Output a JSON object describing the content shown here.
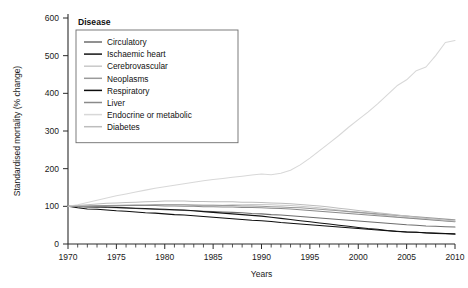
{
  "chart_data": {
    "type": "line",
    "title": "",
    "xlabel": "Years",
    "ylabel": "Standardised mortality (% change)",
    "xlim": [
      1970,
      2010
    ],
    "ylim": [
      0,
      600
    ],
    "xticks": [
      1970,
      1975,
      1980,
      1985,
      1990,
      1995,
      2000,
      2005,
      2010
    ],
    "yticks": [
      0,
      100,
      200,
      300,
      400,
      500,
      600
    ],
    "minor_x_tick_interval": 1,
    "grid": false,
    "legend_position": "top-left",
    "legend_title": "Disease",
    "x": [
      1970,
      1971,
      1972,
      1973,
      1974,
      1975,
      1976,
      1977,
      1978,
      1979,
      1980,
      1981,
      1982,
      1983,
      1984,
      1985,
      1986,
      1987,
      1988,
      1989,
      1990,
      1991,
      1992,
      1993,
      1994,
      1995,
      1996,
      1997,
      1998,
      1999,
      2000,
      2001,
      2002,
      2003,
      2004,
      2005,
      2006,
      2007,
      2008,
      2009,
      2010
    ],
    "series": [
      {
        "name": "Circulatory",
        "color": "#6d6d6d",
        "values": [
          100,
          99,
          98,
          99,
          97,
          96,
          95,
          94,
          93,
          92,
          91,
          90,
          89,
          88,
          87,
          86,
          85,
          84,
          83,
          81,
          80,
          78,
          77,
          75,
          73,
          71,
          69,
          67,
          65,
          63,
          61,
          59,
          57,
          55,
          53,
          51,
          50,
          48,
          47,
          46,
          45
        ]
      },
      {
        "name": "Ischaemic heart",
        "color": "#141414",
        "values": [
          100,
          100,
          99,
          98,
          98,
          97,
          96,
          95,
          94,
          93,
          92,
          91,
          90,
          88,
          86,
          84,
          82,
          80,
          78,
          76,
          74,
          71,
          68,
          65,
          62,
          59,
          56,
          53,
          50,
          47,
          44,
          41,
          39,
          36,
          34,
          32,
          31,
          29,
          28,
          27,
          26
        ]
      },
      {
        "name": "Cerebrovascular",
        "color": "#c9c9c9",
        "values": [
          100,
          101,
          101,
          102,
          102,
          103,
          103,
          104,
          104,
          104,
          105,
          105,
          104,
          104,
          103,
          103,
          103,
          104,
          104,
          105,
          105,
          104,
          103,
          102,
          100,
          98,
          96,
          93,
          90,
          87,
          84,
          81,
          78,
          75,
          72,
          70,
          68,
          66,
          64,
          62,
          60
        ]
      },
      {
        "name": "Neoplasms",
        "color": "#9a9a9a",
        "values": [
          100,
          100,
          101,
          101,
          102,
          102,
          103,
          103,
          103,
          104,
          104,
          104,
          104,
          103,
          103,
          103,
          102,
          102,
          101,
          101,
          100,
          99,
          98,
          97,
          96,
          94,
          92,
          90,
          88,
          86,
          84,
          82,
          80,
          78,
          76,
          74,
          72,
          70,
          68,
          66,
          64
        ]
      },
      {
        "name": "Respiratory",
        "color": "#0d0d0d",
        "values": [
          100,
          96,
          93,
          92,
          90,
          88,
          87,
          85,
          83,
          82,
          80,
          78,
          77,
          75,
          73,
          71,
          69,
          67,
          65,
          63,
          62,
          60,
          57,
          55,
          53,
          51,
          49,
          47,
          45,
          43,
          41,
          39,
          37,
          35,
          33,
          32,
          31,
          30,
          29,
          28,
          27
        ]
      },
      {
        "name": "Liver",
        "color": "#8a8a8a",
        "values": [
          100,
          100,
          100,
          101,
          101,
          101,
          102,
          102,
          102,
          102,
          101,
          101,
          100,
          100,
          99,
          99,
          98,
          98,
          97,
          97,
          96,
          95,
          94,
          93,
          91,
          89,
          87,
          85,
          83,
          81,
          79,
          77,
          75,
          73,
          71,
          69,
          67,
          65,
          63,
          61,
          59
        ]
      },
      {
        "name": "Endocrine or metabolic",
        "color": "#d8d8d8",
        "values": [
          100,
          104,
          110,
          116,
          122,
          128,
          133,
          138,
          143,
          148,
          152,
          156,
          160,
          164,
          168,
          171,
          174,
          177,
          180,
          183,
          186,
          184,
          188,
          196,
          210,
          228,
          248,
          268,
          288,
          310,
          330,
          350,
          372,
          396,
          420,
          436,
          460,
          470,
          500,
          535,
          540
        ]
      },
      {
        "name": "Diabetes",
        "color": "#bdbdbd",
        "values": [
          100,
          102,
          104,
          106,
          108,
          109,
          110,
          111,
          112,
          113,
          114,
          114,
          114,
          113,
          113,
          112,
          112,
          112,
          111,
          111,
          110,
          109,
          108,
          107,
          105,
          103,
          101,
          98,
          95,
          92,
          89,
          86,
          83,
          80,
          77,
          74,
          71,
          68,
          66,
          63,
          61
        ]
      }
    ]
  },
  "legend": {
    "title": "Disease",
    "items": [
      {
        "label": "Circulatory"
      },
      {
        "label": "Ischaemic heart"
      },
      {
        "label": "Cerebrovascular"
      },
      {
        "label": "Neoplasms"
      },
      {
        "label": "Respiratory"
      },
      {
        "label": "Liver"
      },
      {
        "label": "Endocrine or metabolic"
      },
      {
        "label": "Diabetes"
      }
    ]
  }
}
